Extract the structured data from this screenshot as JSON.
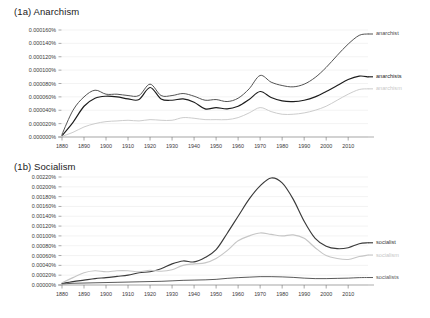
{
  "figure": {
    "panels": [
      {
        "id": "1a",
        "title": "(1a) Anarchism",
        "chart_index": 0
      },
      {
        "id": "1b",
        "title": "(1b) Socialism",
        "chart_index": 1
      }
    ]
  },
  "chart_data": [
    {
      "type": "line",
      "title": "(1a) Anarchism",
      "xlabel": "",
      "ylabel": "",
      "xlim": [
        1880,
        2019
      ],
      "ylim": [
        0.0,
        0.00016
      ],
      "grid": true,
      "legend_position": "right",
      "x_ticks": [
        1880,
        1890,
        1900,
        1910,
        1920,
        1930,
        1940,
        1950,
        1960,
        1970,
        1980,
        1990,
        2000,
        2010
      ],
      "x_tick_labels": [
        "1880",
        "1890",
        "1900",
        "1910",
        "1920",
        "1930",
        "1940",
        "1950",
        "1960",
        "1970",
        "1980",
        "1990",
        "2000",
        "2010"
      ],
      "y_ticks": [
        0.0,
        2e-05,
        4e-05,
        6e-05,
        8e-05,
        0.0001,
        0.00012,
        0.00014,
        0.00016
      ],
      "y_tick_labels": [
        "0.000000%",
        "0.000020%",
        "0.000040%",
        "0.000060%",
        "0.000080%",
        "0.000100%",
        "0.000120%",
        "0.000140%",
        "0.000160%"
      ],
      "x": [
        1880,
        1885,
        1890,
        1895,
        1900,
        1905,
        1910,
        1915,
        1920,
        1925,
        1930,
        1935,
        1940,
        1945,
        1950,
        1955,
        1960,
        1965,
        1970,
        1975,
        1980,
        1985,
        1990,
        1995,
        2000,
        2005,
        2010,
        2015,
        2019
      ],
      "series": [
        {
          "name": "anarchist",
          "color": "#4a4a4a",
          "width": 0.95,
          "values": [
            4e-06,
            4e-05,
            6e-05,
            7e-05,
            6.4e-05,
            6.4e-05,
            6.2e-05,
            6.2e-05,
            7.9e-05,
            6.2e-05,
            6.2e-05,
            6.5e-05,
            6.1e-05,
            5.5e-05,
            5.6e-05,
            5.3e-05,
            5.8e-05,
            7.2e-05,
            9.2e-05,
            8.2e-05,
            7.7e-05,
            7.5e-05,
            7.9e-05,
            8.9e-05,
            0.000104,
            0.000122,
            0.000139,
            0.000152,
            0.000154
          ]
        },
        {
          "name": "anarchists",
          "color": "#1c1c1c",
          "width": 1.15,
          "values": [
            2e-06,
            2.2e-05,
            4.6e-05,
            5.8e-05,
            6.1e-05,
            6e-05,
            5.7e-05,
            5.6e-05,
            7.4e-05,
            5.7e-05,
            5.5e-05,
            5.7e-05,
            5.2e-05,
            4.2e-05,
            4.4e-05,
            4.2e-05,
            4.6e-05,
            5.6e-05,
            6.8e-05,
            5.9e-05,
            5.4e-05,
            5.3e-05,
            5.5e-05,
            6e-05,
            6.8e-05,
            7.7e-05,
            8.6e-05,
            9.1e-05,
            9e-05
          ]
        },
        {
          "name": "anarchism",
          "color": "#c9c9c9",
          "width": 0.95,
          "values": [
            1e-06,
            7e-06,
            1.5e-05,
            2e-05,
            2.3e-05,
            2.4e-05,
            2.5e-05,
            2.4e-05,
            2.6e-05,
            2.5e-05,
            2.5e-05,
            2.9e-05,
            2.8e-05,
            2.6e-05,
            2.6e-05,
            2.6e-05,
            2.9e-05,
            3.6e-05,
            4.4e-05,
            3.8e-05,
            3.4e-05,
            3.4e-05,
            3.6e-05,
            4e-05,
            4.6e-05,
            5.5e-05,
            6.4e-05,
            7.1e-05,
            7.2e-05
          ]
        }
      ]
    },
    {
      "type": "line",
      "title": "(1b) Socialism",
      "xlabel": "",
      "ylabel": "",
      "xlim": [
        1880,
        2019
      ],
      "ylim": [
        0.0,
        0.0022
      ],
      "grid": true,
      "legend_position": "right",
      "x_ticks": [
        1880,
        1890,
        1900,
        1910,
        1920,
        1930,
        1940,
        1950,
        1960,
        1970,
        1980,
        1990,
        2000,
        2010
      ],
      "x_tick_labels": [
        "1880",
        "1890",
        "1900",
        "1910",
        "1920",
        "1930",
        "1940",
        "1950",
        "1960",
        "1970",
        "1980",
        "1990",
        "2000",
        "2010"
      ],
      "y_ticks": [
        0.0,
        0.0002,
        0.0004,
        0.0006,
        0.0008,
        0.001,
        0.0012,
        0.0014,
        0.0016,
        0.0018,
        0.002,
        0.0022
      ],
      "y_tick_labels": [
        "0.00000%",
        "0.00020%",
        "0.00040%",
        "0.00060%",
        "0.00080%",
        "0.00100%",
        "0.00120%",
        "0.00140%",
        "0.00160%",
        "0.00180%",
        "0.00200%",
        "0.00220%"
      ],
      "x": [
        1880,
        1885,
        1890,
        1895,
        1900,
        1905,
        1910,
        1915,
        1920,
        1925,
        1930,
        1935,
        1940,
        1945,
        1950,
        1955,
        1960,
        1965,
        1970,
        1975,
        1980,
        1985,
        1990,
        1995,
        2000,
        2005,
        2010,
        2015,
        2019
      ],
      "series": [
        {
          "name": "socialist",
          "color": "#3a3a3a",
          "width": 1.15,
          "values": [
            3e-05,
            7e-05,
            0.0001,
            0.00013,
            0.00015,
            0.000175,
            0.0002,
            0.00025,
            0.00027,
            0.00033,
            0.00043,
            0.00049,
            0.00047,
            0.00056,
            0.00072,
            0.00105,
            0.0014,
            0.00175,
            0.00202,
            0.00218,
            0.00208,
            0.00175,
            0.0013,
            0.00095,
            0.00079,
            0.00074,
            0.00076,
            0.00084,
            0.00086
          ]
        },
        {
          "name": "socialism",
          "color": "#c6c6c6",
          "width": 1.15,
          "values": [
            4.5e-05,
            0.00015,
            0.00025,
            0.00029,
            0.00027,
            0.00029,
            0.00029,
            0.00027,
            0.0003,
            0.00028,
            0.00031,
            0.0004,
            0.00043,
            0.00045,
            0.00054,
            0.0007,
            0.0009,
            0.001,
            0.00106,
            0.00103,
            0.001,
            0.00102,
            0.00095,
            0.00076,
            0.0006,
            0.00054,
            0.00052,
            0.00058,
            0.00061
          ]
        },
        {
          "name": "socialists",
          "color": "#5a5a5a",
          "width": 1.0,
          "values": [
            2e-05,
            3.5e-05,
            4e-05,
            4.5e-05,
            5e-05,
            5.5e-05,
            6e-05,
            6.5e-05,
            7e-05,
            7.5e-05,
            8.5e-05,
            9.5e-05,
            0.0001,
            0.000105,
            0.000115,
            0.000135,
            0.00015,
            0.00016,
            0.00017,
            0.00017,
            0.000165,
            0.000155,
            0.00014,
            0.00013,
            0.00013,
            0.000135,
            0.00014,
            0.00015,
            0.000152
          ]
        }
      ]
    }
  ]
}
